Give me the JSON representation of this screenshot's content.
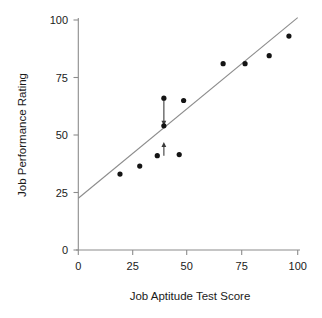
{
  "chart_data": {
    "type": "scatter",
    "title": "",
    "subtitle": "",
    "xlabel": "Job Aptitude Test Score",
    "ylabel": "Job Performance Rating",
    "xlim": [
      0,
      100
    ],
    "ylim": [
      0,
      100
    ],
    "xticks": [
      0,
      25,
      50,
      75,
      100
    ],
    "yticks": [
      0,
      25,
      50,
      75,
      100
    ],
    "xtick_labels": [
      "0",
      "25",
      "50",
      "75",
      "100"
    ],
    "ytick_labels": [
      "0",
      "25",
      "50",
      "75",
      "100"
    ],
    "grid": false,
    "legend": null,
    "legend_position": "none",
    "series": [
      {
        "name": "Observations",
        "marker": "filled-circle",
        "color": "#141414",
        "points": [
          {
            "x": 19,
            "y": 33
          },
          {
            "x": 28,
            "y": 36.5
          },
          {
            "x": 36,
            "y": 41
          },
          {
            "x": 39,
            "y": 66
          },
          {
            "x": 39,
            "y": 54
          },
          {
            "x": 46,
            "y": 41.5
          },
          {
            "x": 48,
            "y": 65
          },
          {
            "x": 66,
            "y": 81
          },
          {
            "x": 76,
            "y": 81
          },
          {
            "x": 87,
            "y": 84.5
          },
          {
            "x": 96,
            "y": 93
          }
        ]
      }
    ],
    "fit_line": {
      "name": "Regression line",
      "color": "#8c8c8c",
      "intercept": 22.5,
      "slope": 0.785,
      "x_start": 0,
      "x_end": 100,
      "y_start": 22.5,
      "y_end": 101
    },
    "annotations": [
      {
        "name": "residual-arrow-above",
        "type": "arrow",
        "x": 39,
        "y_from": 66,
        "y_to": 54,
        "direction": "down",
        "description": "Residual from point above the line down to the regression line"
      },
      {
        "name": "residual-arrow-below",
        "type": "arrow",
        "x": 39,
        "y_from": 41,
        "y_to": 47,
        "direction": "up",
        "description": "Residual from point below the line up to the regression line"
      }
    ]
  },
  "axes": {
    "x_title": "Job Aptitude Test Score",
    "y_title": "Job Performance Rating"
  },
  "ticks": {
    "y": [
      "100",
      "75",
      "50",
      "25",
      "0"
    ],
    "x": [
      "0",
      "25",
      "50",
      "75",
      "100"
    ]
  },
  "colors": {
    "point": "#141414",
    "line": "#8c8c8c",
    "arrow": "#3a3a3a",
    "text": "#1a1a1a",
    "background": "#ffffff"
  }
}
